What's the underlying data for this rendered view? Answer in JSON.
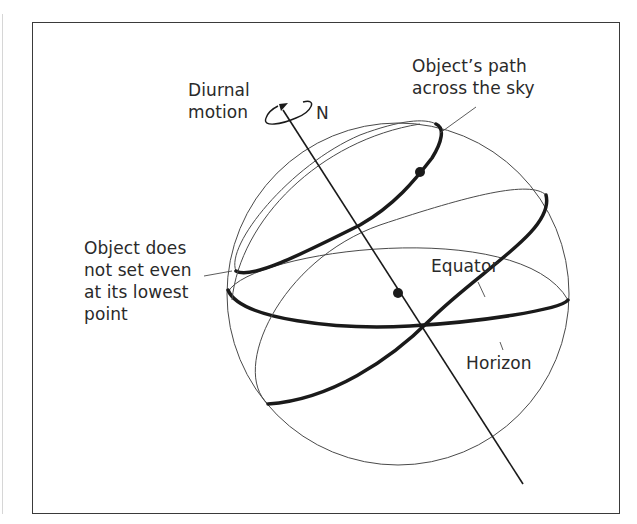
{
  "figure": {
    "type": "celestial-sphere-diagram",
    "labels": {
      "diurnal_line1": "Diurnal",
      "diurnal_line2": "motion",
      "north": "N",
      "path_line1": "Object’s path",
      "path_line2": "across the sky",
      "nonset_line1": "Object does",
      "nonset_line2": "not set even",
      "nonset_line3": "at its lowest",
      "nonset_line4": "point",
      "equator": "Equator",
      "horizon": "Horizon"
    },
    "colors": {
      "ink": "#1a1a1a",
      "thin_line": "#4a4a4a",
      "frame": "#3a3a3a",
      "background": "#ffffff"
    }
  }
}
